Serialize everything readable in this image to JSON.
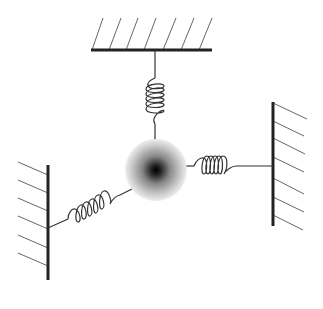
{
  "diagram": {
    "type": "mass-spring-system",
    "colors": {
      "line": "#222222",
      "hatch": "#666666",
      "mass_center": "#000000",
      "mass_edge": "#e8e8e8"
    },
    "mass": {
      "cx": 156,
      "cy": 170,
      "r": 31
    },
    "walls": [
      {
        "name": "top-wall",
        "x1": 91,
        "y1": 50,
        "x2": 212,
        "y2": 50
      },
      {
        "name": "right-wall",
        "x1": 273,
        "y1": 102,
        "x2": 273,
        "y2": 226
      },
      {
        "name": "left-wall",
        "x1": 48,
        "y1": 165,
        "x2": 48,
        "y2": 280
      }
    ],
    "springs": [
      {
        "name": "top-spring",
        "from": [
          155,
          50
        ],
        "to": [
          156,
          170
        ]
      },
      {
        "name": "right-spring",
        "from": [
          156,
          170
        ],
        "to": [
          273,
          165
        ]
      },
      {
        "name": "left-spring",
        "from": [
          48,
          226
        ],
        "to": [
          156,
          170
        ]
      }
    ]
  }
}
